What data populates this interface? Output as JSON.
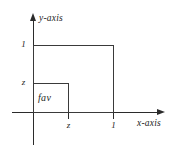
{
  "chart_data": {
    "type": "diagram",
    "title": "",
    "xlabel": "x-axis",
    "ylabel": "y-axis",
    "xlim": [
      0,
      1.4
    ],
    "ylim": [
      0,
      1.4
    ],
    "grid": false,
    "legend": null,
    "x_ticks": [
      "z",
      "1"
    ],
    "x_tick_values": [
      0.45,
      1.0
    ],
    "y_ticks": [
      "1",
      "z"
    ],
    "y_tick_values": [
      1.0,
      0.45
    ],
    "shapes": [
      {
        "name": "outer-square",
        "kind": "rectangle",
        "x0": 0,
        "y0": 0,
        "x1": 1.0,
        "y1": 1.0,
        "filled": false,
        "label": ""
      },
      {
        "name": "inner-square",
        "kind": "rectangle",
        "x0": 0,
        "y0": 0,
        "x1": 0.45,
        "y1": 0.45,
        "filled": false,
        "label": "fav"
      }
    ],
    "annotations": [
      {
        "text": "fav",
        "x": 0.2,
        "y": 0.22
      }
    ]
  },
  "figure": {
    "y_axis_title": "y-axis",
    "x_axis_title": "x-axis",
    "region_label": "fav",
    "ticks": {
      "y_one": "1",
      "y_z": "z",
      "x_z": "z",
      "x_one": "1"
    },
    "colors": {
      "line": "#2b2b2b",
      "text": "#1d1d1d",
      "background": "#ffffff"
    }
  }
}
